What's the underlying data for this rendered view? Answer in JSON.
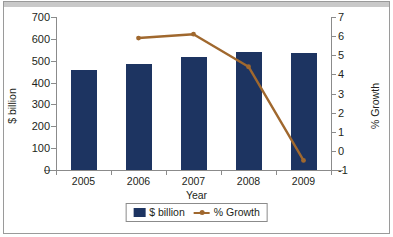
{
  "chart_data": {
    "type": "bar",
    "title": "",
    "subtitle": "",
    "xlabel": "Year",
    "ylabel": "$ billion",
    "y2label": "% Growth",
    "categories": [
      "2005",
      "2006",
      "2007",
      "2008",
      "2009"
    ],
    "grid": false,
    "legend_position": "bottom",
    "ylim": [
      0,
      700
    ],
    "y2lim": [
      -1,
      7
    ],
    "yticks": [
      0,
      100,
      200,
      300,
      400,
      500,
      600,
      700
    ],
    "ytick_labels": [
      "0",
      "100",
      "200",
      "300",
      "400",
      "500",
      "600",
      "700"
    ],
    "y2ticks": [
      -1,
      0,
      1,
      2,
      3,
      4,
      5,
      6,
      7
    ],
    "y2tick_labels": [
      "-1",
      "0",
      "1",
      "2",
      "3",
      "4",
      "5",
      "6",
      "7"
    ],
    "series": [
      {
        "name": "$ billion",
        "type": "bar",
        "axis": "left",
        "color": "#1d3461",
        "values": [
          458,
          485,
          515,
          540,
          535
        ]
      },
      {
        "name": "% Growth",
        "type": "line",
        "axis": "right",
        "color": "#a0682e",
        "values": [
          null,
          5.9,
          6.1,
          4.4,
          -0.5
        ]
      }
    ],
    "legend": [
      "$ billion",
      "% Growth"
    ]
  },
  "colors": {
    "bar": "#1d3461",
    "line": "#a0682e",
    "axis": "#8b8b8b",
    "text": "#231f20",
    "frame": "#9a9a9a",
    "topbar": "#c9c9c9",
    "background": "#ffffff"
  }
}
